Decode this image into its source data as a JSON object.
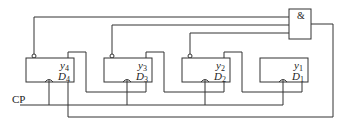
{
  "diagram": {
    "title": "",
    "gate": {
      "label": "&",
      "type": "AND"
    },
    "clock": {
      "label": "CP"
    },
    "flip_flops": [
      {
        "id": "ff4",
        "output": "y",
        "output_sub": "4",
        "input": "D",
        "input_sub": "4"
      },
      {
        "id": "ff3",
        "output": "y",
        "output_sub": "3",
        "input": "D",
        "input_sub": "3"
      },
      {
        "id": "ff2",
        "output": "y",
        "output_sub": "2",
        "input": "D",
        "input_sub": "2"
      },
      {
        "id": "ff1",
        "output": "y",
        "output_sub": "1",
        "input": "D",
        "input_sub": "1"
      }
    ],
    "colors": {
      "line": "#333333",
      "background": "#ffffff"
    }
  }
}
